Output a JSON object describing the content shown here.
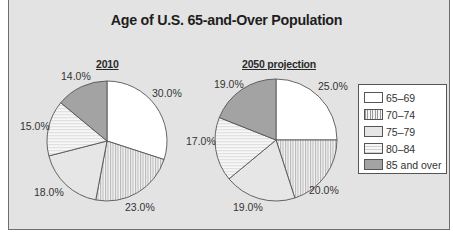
{
  "chart_data": [
    {
      "type": "pie",
      "title": "Age of U.S. 65-and-Over Population",
      "subtitle": "2010",
      "categories": [
        "65–69",
        "70–74",
        "75–79",
        "80–84",
        "85 and over"
      ],
      "values": [
        30.0,
        23.0,
        18.0,
        15.0,
        14.0
      ],
      "labels": [
        "30.0%",
        "23.0%",
        "18.0%",
        "15.0%",
        "14.0%"
      ]
    },
    {
      "type": "pie",
      "title": "Age of U.S. 65-and-Over Population",
      "subtitle": "2050 projection",
      "categories": [
        "65–69",
        "70–74",
        "75–79",
        "80–84",
        "85 and over"
      ],
      "values": [
        25.0,
        20.0,
        19.0,
        17.0,
        19.0
      ],
      "labels": [
        "25.0%",
        "20.0%",
        "19.0%",
        "17.0%",
        "19.0%"
      ]
    }
  ],
  "chart": {
    "title": "Age of U.S. 65-and-Over Population",
    "pie1_title": "2010",
    "pie2_title": "2050 projection",
    "legend": [
      {
        "label": "65–69",
        "pattern": "white"
      },
      {
        "label": "70–74",
        "pattern": "vertical-lines"
      },
      {
        "label": "75–79",
        "pattern": "light-gray"
      },
      {
        "label": "80–84",
        "pattern": "horizontal-lines"
      },
      {
        "label": "85 and over",
        "pattern": "dark-gray"
      }
    ],
    "pie1_labels": [
      "30.0%",
      "23.0%",
      "18.0%",
      "15.0%",
      "14.0%"
    ],
    "pie2_labels": [
      "25.0%",
      "20.0%",
      "19.0%",
      "17.0%",
      "19.0%"
    ]
  },
  "colors": {
    "background": "#e3e3e3",
    "slice_65_69": "#ffffff",
    "slice_75_79": "#e6e6e6",
    "slice_85_over": "#a3a3a3",
    "outline": "#555555"
  }
}
